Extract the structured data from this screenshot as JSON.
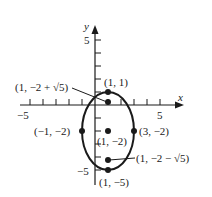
{
  "diagram": {
    "type": "ellipse-graph",
    "equation_hint": "ellipse centered at (1, -2), horizontal semi-axis 2, vertical semi-axis 3",
    "axes": {
      "x_label": "x",
      "y_label": "y",
      "x_ticks": [
        -5,
        -4,
        -3,
        -2,
        -1,
        1,
        2,
        3,
        4,
        5
      ],
      "y_ticks": [
        -5,
        -4,
        -3,
        -2,
        -1,
        1,
        2,
        3,
        4,
        5
      ],
      "x_tick_labels": {
        "neg": "−5",
        "pos": "5"
      },
      "y_tick_labels": {
        "neg": "−5",
        "pos": "5"
      }
    },
    "ellipse": {
      "center": [
        1,
        -2
      ],
      "rx": 2,
      "ry": 3
    },
    "points": [
      {
        "id": "vertex-top",
        "x": 1,
        "y": 1,
        "label": "(1, 1)"
      },
      {
        "id": "focus-top",
        "x": 1,
        "y": 0.236,
        "label": "(1, −2 + √5)"
      },
      {
        "id": "center",
        "x": 1,
        "y": -2,
        "label": "(1, −2)"
      },
      {
        "id": "covertex-left",
        "x": -1,
        "y": -2,
        "label": "(−1, −2)"
      },
      {
        "id": "covertex-right",
        "x": 3,
        "y": -2,
        "label": "(3, −2)"
      },
      {
        "id": "focus-bottom",
        "x": 1,
        "y": -4.236,
        "label": "(1, −2 − √5)"
      },
      {
        "id": "vertex-bottom",
        "x": 1,
        "y": -5,
        "label": "(1, −5)"
      }
    ],
    "colors": {
      "ink": "#1a1a1a",
      "background": "#ffffff"
    }
  }
}
